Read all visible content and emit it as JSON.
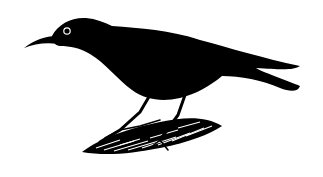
{
  "image": {
    "subject": "black bird perched on a rock",
    "style": "ink illustration",
    "colors": {
      "background": "#ffffff",
      "ink": "#000000",
      "eye_ring": "#ffffff"
    }
  }
}
